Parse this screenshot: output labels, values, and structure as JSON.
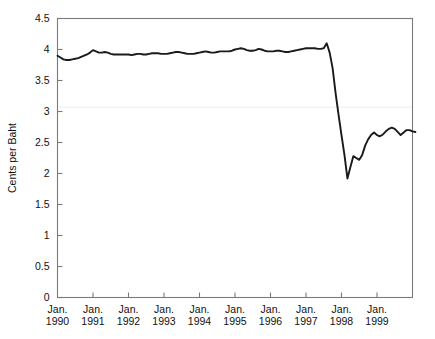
{
  "chart_data": {
    "type": "line",
    "title": "",
    "subtitle": "",
    "xlabel": "",
    "ylabel": "Cents per Baht",
    "ylim": [
      0,
      4.5
    ],
    "yticks": [
      0,
      0.5,
      1,
      1.5,
      2,
      2.5,
      3,
      3.5,
      4,
      4.5
    ],
    "ytick_labels": [
      "0",
      "0.5",
      "1",
      "1.5",
      "2",
      "2.5",
      "3",
      "3.5",
      "4",
      "4.5"
    ],
    "xlim": [
      "Jan. 1990",
      "Jan. 2000"
    ],
    "xticks": [
      "Jan. 1990",
      "Jan. 1991",
      "Jan. 1992",
      "Jan. 1993",
      "Jan. 1994",
      "Jan. 1995",
      "Jan. 1996",
      "Jan. 1997",
      "Jan. 1998",
      "Jan. 1999"
    ],
    "xtick_labels": [
      {
        "month": "Jan.",
        "year": "1990"
      },
      {
        "month": "Jan.",
        "year": "1991"
      },
      {
        "month": "Jan.",
        "year": "1992"
      },
      {
        "month": "Jan.",
        "year": "1993"
      },
      {
        "month": "Jan.",
        "year": "1994"
      },
      {
        "month": "Jan.",
        "year": "1995"
      },
      {
        "month": "Jan.",
        "year": "1996"
      },
      {
        "month": "Jan.",
        "year": "1997"
      },
      {
        "month": "Jan.",
        "year": "1998"
      },
      {
        "month": "Jan.",
        "year": "1999"
      }
    ],
    "grid": false,
    "legend": null,
    "line_color": "#1a1a1a",
    "axis_color": "#7a7a7a",
    "background_color": "#ffffff",
    "series": [
      {
        "name": "Cents per Baht",
        "x_start": 1990.0,
        "x_step": 0.08333,
        "values": [
          3.9,
          3.87,
          3.84,
          3.83,
          3.83,
          3.84,
          3.85,
          3.86,
          3.88,
          3.9,
          3.92,
          3.95,
          3.99,
          3.97,
          3.95,
          3.95,
          3.96,
          3.95,
          3.93,
          3.92,
          3.92,
          3.92,
          3.92,
          3.92,
          3.92,
          3.91,
          3.92,
          3.93,
          3.93,
          3.92,
          3.92,
          3.93,
          3.94,
          3.94,
          3.94,
          3.93,
          3.93,
          3.93,
          3.94,
          3.95,
          3.96,
          3.96,
          3.95,
          3.94,
          3.93,
          3.93,
          3.93,
          3.94,
          3.95,
          3.96,
          3.97,
          3.96,
          3.95,
          3.95,
          3.96,
          3.97,
          3.97,
          3.97,
          3.97,
          3.98,
          4.0,
          4.01,
          4.02,
          4.01,
          3.99,
          3.98,
          3.98,
          3.99,
          4.01,
          4.0,
          3.98,
          3.97,
          3.97,
          3.97,
          3.98,
          3.98,
          3.97,
          3.96,
          3.96,
          3.97,
          3.98,
          3.99,
          4.0,
          4.01,
          4.02,
          4.02,
          4.02,
          4.02,
          4.01,
          4.01,
          4.02,
          4.1,
          3.95,
          3.7,
          3.3,
          2.95,
          2.62,
          2.3,
          1.92,
          2.1,
          2.28,
          2.25,
          2.22,
          2.3,
          2.45,
          2.55,
          2.62,
          2.66,
          2.62,
          2.6,
          2.63,
          2.68,
          2.72,
          2.74,
          2.72,
          2.67,
          2.62,
          2.66,
          2.7,
          2.7,
          2.68,
          2.67
        ]
      }
    ],
    "annotations": []
  }
}
